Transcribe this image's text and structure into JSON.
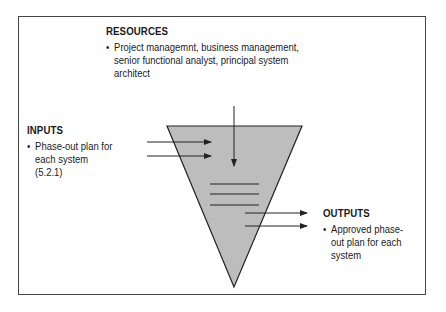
{
  "resources": {
    "title": "RESOURCES",
    "items": [
      "Project managemnt, business management, senior functional analyst, principal system architect"
    ]
  },
  "inputs": {
    "title": "INPUTS",
    "items": [
      "Phase-out plan for each system (5.2.1)"
    ]
  },
  "outputs": {
    "title": "OUTPUTS",
    "items": [
      "Approved phase-out plan for each system"
    ]
  },
  "colors": {
    "funnel_fill": "#bdbdbd",
    "stroke": "#222222"
  }
}
